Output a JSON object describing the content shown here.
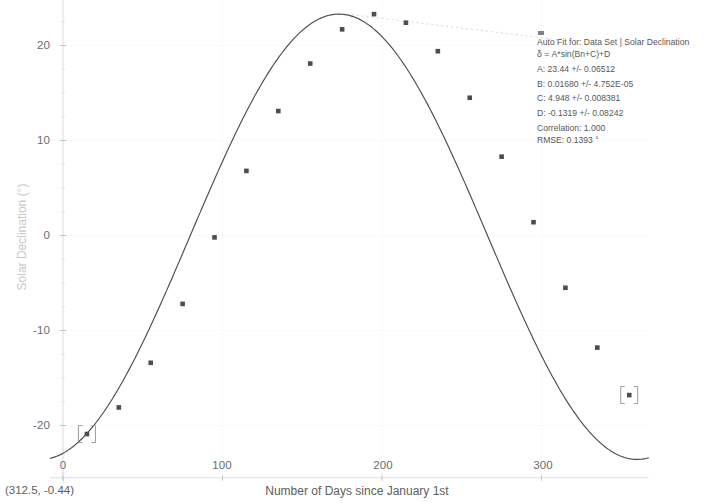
{
  "chart_data": {
    "type": "scatter",
    "title": "",
    "xlabel": "Number of Days since January 1st",
    "ylabel": "Solar Declination (°)",
    "xlim": [
      -8,
      367
    ],
    "ylim": [
      -25.5,
      25.5
    ],
    "grid": true,
    "xticks": [
      0,
      100,
      200,
      300
    ],
    "yticks": [
      20,
      10,
      0,
      -10,
      -20
    ],
    "xtick_labels": [
      "0",
      "100",
      "200",
      "300"
    ],
    "ytick_labels": [
      "20",
      "10",
      "0",
      "-10",
      "-20"
    ],
    "series": [
      {
        "name": "Data Set | Solar Declination",
        "marker": "square",
        "color": "#4d4d4d",
        "x": [
          15,
          35,
          55,
          75,
          95,
          115,
          135,
          155,
          175,
          195,
          215,
          235,
          255,
          275,
          295,
          315,
          335,
          355
        ],
        "y": [
          -20.9,
          -18.1,
          -13.4,
          -7.2,
          -0.2,
          6.8,
          13.1,
          18.1,
          21.7,
          23.3,
          22.4,
          19.4,
          14.5,
          8.3,
          1.4,
          -5.5,
          -11.8,
          -16.8
        ]
      }
    ],
    "fit_curve": {
      "name": "Auto Fit",
      "color": "#4d4d4d",
      "equation": "A*sin(Bn+C)+D",
      "A": 23.44,
      "B": 0.0168,
      "C": 4.948,
      "D": -0.1319
    },
    "selected_points": [
      {
        "x": 15,
        "y": -20.9
      },
      {
        "x": 355,
        "y": -16.8
      }
    ]
  },
  "annotation": {
    "legend_marker": "data-set-square-marker",
    "title": "Auto Fit for: Data Set | Solar Declination",
    "equation": "δ = A*sin(Bn+C)+D",
    "param_a": "A: 23.44 +/- 0.06512",
    "param_b": "B: 0.01680 +/- 4.752E-05",
    "param_c": "C: 4.948 +/- 0.008381",
    "param_d": "D: -0.1319 +/- 0.08242",
    "correlation": "Correlation: 1.000",
    "rmse": "RMSE: 0.1393 °"
  },
  "axes": {
    "x_title": "Number of Days since January 1st",
    "y_title": "Solar Declination (°)",
    "x_tick_0": "0",
    "x_tick_1": "100",
    "x_tick_2": "200",
    "x_tick_3": "300",
    "y_tick_0": "20",
    "y_tick_1": "10",
    "y_tick_2": "0",
    "y_tick_3": "-10",
    "y_tick_4": "-20"
  },
  "status": {
    "coordinate_readout": "(312.5, -0.44)"
  },
  "colors": {
    "curve": "#4d4d4d",
    "marker": "#4d4d4d",
    "grid": "#ebebeb",
    "axis": "#dcdcdc",
    "text": "#5d5d5d",
    "y_title": "#c9c9c9",
    "leader_line": "#d8d8d8"
  }
}
